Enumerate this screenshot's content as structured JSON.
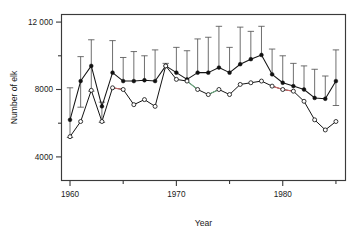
{
  "chart_data": {
    "type": "line",
    "title": "",
    "xlabel": "Year",
    "ylabel": "Number of elk",
    "xlim": [
      1959.2,
      1985.9
    ],
    "ylim": [
      2600,
      12450
    ],
    "grid": false,
    "legend_position": "none",
    "x_major_ticks": [
      1960,
      1970,
      1980
    ],
    "x_major_tick_labels": [
      "1960",
      "1970",
      "1980"
    ],
    "x_minor_ticks": [
      1965,
      1975,
      1985
    ],
    "y_major_ticks": [
      4000,
      8000,
      12000
    ],
    "y_major_tick_labels": [
      "4000",
      "8000",
      "12 000"
    ],
    "y_minor_ticks": [
      6000,
      10000
    ],
    "x": [
      1960,
      1961,
      1962,
      1963,
      1964,
      1965,
      1966,
      1967,
      1968,
      1969,
      1970,
      1971,
      1972,
      1973,
      1974,
      1975,
      1976,
      1977,
      1978,
      1979,
      1980,
      1981,
      1982,
      1983,
      1984,
      1985
    ],
    "series": [
      {
        "name": "estimate-filled",
        "marker": "filled-circle",
        "values": [
          6200,
          8500,
          9400,
          7000,
          9000,
          8500,
          8500,
          8550,
          8500,
          9400,
          9000,
          8600,
          9000,
          9000,
          9300,
          9000,
          9500,
          9800,
          10050,
          8900,
          8400,
          8200,
          8000,
          7500,
          7450,
          8500
        ],
        "error_upper": [
          8100,
          9950,
          10950,
          7250,
          10900,
          9900,
          10250,
          10000,
          10350,
          9550,
          10500,
          10300,
          11000,
          11100,
          11750,
          10500,
          11700,
          11450,
          11750,
          10400,
          10000,
          9550,
          9400,
          9200,
          8800,
          10350
        ],
        "error_lower": [
          5150,
          6950,
          7900,
          6050,
          null,
          null,
          null,
          null,
          null,
          null,
          null,
          null,
          null,
          null,
          null,
          null,
          null,
          null,
          null,
          null,
          null,
          null,
          null,
          null,
          null,
          7050
        ]
      },
      {
        "name": "count-open",
        "marker": "open-circle",
        "values": [
          5200,
          6100,
          7950,
          6100,
          8100,
          8000,
          7100,
          7400,
          7000,
          9400,
          8600,
          8500,
          8000,
          7700,
          8000,
          7700,
          8300,
          8400,
          8500,
          8200,
          8000,
          7900,
          7300,
          6200,
          5600,
          6100
        ]
      }
    ],
    "accent_segments": [
      {
        "color": "#d06a6a",
        "from_year": 1964,
        "to_year": 1965,
        "series": "count-open"
      },
      {
        "color": "#6fae84",
        "from_year": 1971,
        "to_year": 1972,
        "series": "count-open"
      },
      {
        "color": "#6fae84",
        "from_year": 1973,
        "to_year": 1974,
        "series": "count-open"
      },
      {
        "color": "#d06a6a",
        "from_year": 1979,
        "to_year": 1980,
        "series": "count-open"
      },
      {
        "color": "#d06a6a",
        "from_year": 1980,
        "to_year": 1981,
        "series": "count-open"
      }
    ],
    "colors": {
      "marker_filled": "#111111",
      "marker_open_stroke": "#141414",
      "marker_open_fill": "#ffffff",
      "line": "#141414",
      "errorbar": "#555555",
      "frame": "#3a3a3a",
      "accent_red": "#d06a6a",
      "accent_green": "#6fae84",
      "background": "#ffffff"
    }
  }
}
